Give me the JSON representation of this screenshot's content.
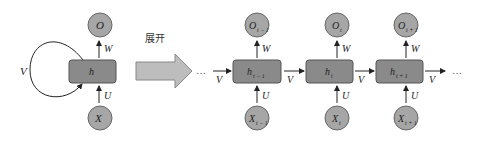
{
  "diagram": {
    "title_label": "展开",
    "colors": {
      "node_fill": "#8a8a8a",
      "circle_fill": "#a6a6a6",
      "stroke": "#555555",
      "arrow_fill": "#bdbdbd",
      "line": "#222222"
    },
    "folded": {
      "hidden": "h",
      "output": "O",
      "input": "X",
      "w_label": "W",
      "u_label": "U",
      "v_label": "V"
    },
    "unrolled": {
      "ellipsis_left": "…",
      "ellipsis_right": "…",
      "steps": [
        {
          "hidden": "h",
          "hidden_sub": "t − 1",
          "output": "O",
          "output_sub": "t − 1",
          "input": "X",
          "input_sub": "t − 1",
          "w_label": "W",
          "u_label": "U",
          "v_in": "V"
        },
        {
          "hidden": "h",
          "hidden_sub": "t",
          "output": "O",
          "output_sub": "t",
          "input": "X",
          "input_sub": "t",
          "w_label": "W",
          "u_label": "U",
          "v_in": "V"
        },
        {
          "hidden": "h",
          "hidden_sub": "t + 1",
          "output": "O",
          "output_sub": "t + 1",
          "input": "X",
          "input_sub": "t + 1",
          "w_label": "W",
          "u_label": "U",
          "v_in": "V"
        }
      ],
      "v_out": "V"
    }
  }
}
